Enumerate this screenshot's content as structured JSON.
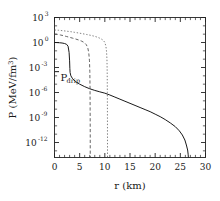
{
  "chart_data": {
    "type": "line",
    "title": "",
    "xlabel": "r (km)",
    "ylabel": "P (MeV/fm",
    "ylabel_exponent": "3",
    "ylabel_close": ")",
    "xlim": [
      0,
      30
    ],
    "ylim_log10": [
      -13.8,
      3
    ],
    "xscale": "linear",
    "yscale": "log",
    "grid": false,
    "legend": "none",
    "x_ticks": [
      "0",
      "5",
      "10",
      "15",
      "20",
      "25",
      "30"
    ],
    "x_tick_values": [
      0,
      5,
      10,
      15,
      20,
      25,
      30
    ],
    "x_minor_step": 1,
    "y_ticks": [
      {
        "mantissa": "10",
        "exponent": "3",
        "log10": 3
      },
      {
        "mantissa": "10",
        "exponent": "0",
        "log10": 0
      },
      {
        "mantissa": "10",
        "exponent": "-3",
        "log10": -3
      },
      {
        "mantissa": "10",
        "exponent": "-6",
        "log10": -6
      },
      {
        "mantissa": "10",
        "exponent": "-9",
        "log10": -9
      },
      {
        "mantissa": "10",
        "exponent": "-12",
        "log10": -12
      }
    ],
    "annotations": [
      {
        "name": "p-drip-label",
        "text": "P",
        "subscript": "drip",
        "x_km": 1.2,
        "y_log10": -4.6
      }
    ],
    "marker_lines": [
      {
        "name": "p-drip-level-tick",
        "orientation": "horizontal",
        "y_log10": -3.5,
        "x_start_km": 0.0,
        "x_end_km": 0.9
      }
    ],
    "series": [
      {
        "name": "solid-profile",
        "style": "solid",
        "color": "#1a1a1a",
        "central_pressure": 1.0,
        "radius_km": 26.6,
        "points": [
          [
            0.0,
            0.0
          ],
          [
            0.5,
            -0.01
          ],
          [
            1.0,
            -0.03
          ],
          [
            1.5,
            -0.06
          ],
          [
            2.0,
            -0.12
          ],
          [
            2.4,
            -0.22
          ],
          [
            2.7,
            -0.45
          ],
          [
            2.9,
            -1.2
          ],
          [
            3.0,
            -2.2
          ],
          [
            3.05,
            -3.1
          ],
          [
            3.1,
            -3.6
          ],
          [
            3.25,
            -4.0
          ],
          [
            3.6,
            -4.35
          ],
          [
            4.2,
            -4.7
          ],
          [
            5.0,
            -5.0
          ],
          [
            6.0,
            -5.3
          ],
          [
            7.0,
            -5.55
          ],
          [
            8.0,
            -5.75
          ],
          [
            9.0,
            -5.92
          ],
          [
            10.0,
            -6.08
          ],
          [
            11.0,
            -6.3
          ],
          [
            12.0,
            -6.55
          ],
          [
            13.0,
            -6.8
          ],
          [
            14.0,
            -7.05
          ],
          [
            15.0,
            -7.3
          ],
          [
            16.0,
            -7.55
          ],
          [
            17.0,
            -7.8
          ],
          [
            18.0,
            -8.05
          ],
          [
            19.0,
            -8.3
          ],
          [
            20.0,
            -8.6
          ],
          [
            21.0,
            -8.9
          ],
          [
            22.0,
            -9.25
          ],
          [
            23.0,
            -9.65
          ],
          [
            24.0,
            -10.1
          ],
          [
            24.8,
            -10.6
          ],
          [
            25.4,
            -11.1
          ],
          [
            25.9,
            -11.7
          ],
          [
            26.2,
            -12.3
          ],
          [
            26.45,
            -12.9
          ],
          [
            26.55,
            -13.4
          ],
          [
            26.6,
            -13.8
          ]
        ]
      },
      {
        "name": "long-dashed-profile",
        "style": "dashed",
        "color": "#4a4a4a",
        "central_pressure": 10.0,
        "radius_km": 7.1,
        "points": [
          [
            0.0,
            1.0
          ],
          [
            0.6,
            0.97
          ],
          [
            1.2,
            0.9
          ],
          [
            1.8,
            0.82
          ],
          [
            2.4,
            0.72
          ],
          [
            3.0,
            0.62
          ],
          [
            3.6,
            0.52
          ],
          [
            4.2,
            0.42
          ],
          [
            4.8,
            0.3
          ],
          [
            5.4,
            0.16
          ],
          [
            5.9,
            0.0
          ],
          [
            6.3,
            -0.25
          ],
          [
            6.6,
            -0.6
          ],
          [
            6.8,
            -1.2
          ],
          [
            6.95,
            -2.2
          ],
          [
            7.02,
            -3.5
          ],
          [
            7.06,
            -5.5
          ],
          [
            7.08,
            -8.0
          ],
          [
            7.1,
            -11.0
          ],
          [
            7.1,
            -13.8
          ]
        ]
      },
      {
        "name": "dotted-profile",
        "style": "dotted",
        "color": "#6a6a6a",
        "central_pressure": 30.0,
        "radius_km": 10.5,
        "points": [
          [
            0.0,
            1.5
          ],
          [
            0.8,
            1.47
          ],
          [
            1.6,
            1.42
          ],
          [
            2.4,
            1.36
          ],
          [
            3.2,
            1.3
          ],
          [
            4.0,
            1.22
          ],
          [
            4.8,
            1.14
          ],
          [
            5.6,
            1.05
          ],
          [
            6.4,
            0.96
          ],
          [
            7.2,
            0.86
          ],
          [
            8.0,
            0.74
          ],
          [
            8.6,
            0.62
          ],
          [
            9.2,
            0.46
          ],
          [
            9.7,
            0.26
          ],
          [
            10.0,
            0.0
          ],
          [
            10.2,
            -0.4
          ],
          [
            10.33,
            -1.0
          ],
          [
            10.42,
            -2.0
          ],
          [
            10.47,
            -3.5
          ],
          [
            10.5,
            -6.0
          ],
          [
            10.52,
            -9.0
          ],
          [
            10.53,
            -12.0
          ],
          [
            10.53,
            -13.8
          ]
        ]
      }
    ]
  }
}
